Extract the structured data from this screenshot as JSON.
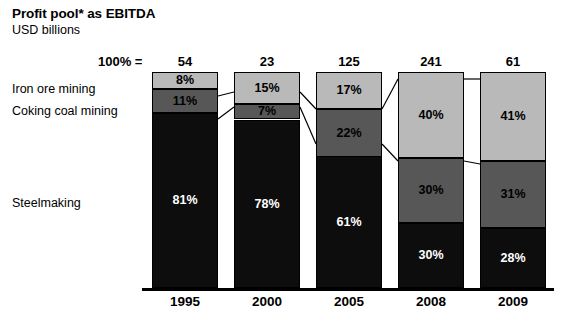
{
  "header": {
    "title": "Profit pool* as EBITDA",
    "subtitle": "USD billions"
  },
  "axis": {
    "total_prefix": "100% =",
    "years": [
      "1995",
      "2000",
      "2005",
      "2008",
      "2009"
    ],
    "totals": [
      "54",
      "23",
      "125",
      "241",
      "61"
    ]
  },
  "categories": [
    {
      "key": "iron_ore",
      "label": "Iron ore mining",
      "color": "#b9b9b9"
    },
    {
      "key": "coking_coal",
      "label": "Coking coal mining",
      "color": "#575757"
    },
    {
      "key": "steelmaking",
      "label": "Steelmaking",
      "color": "#0d0d0d"
    }
  ],
  "labels": {
    "iron_ore": [
      "8%",
      "15%",
      "17%",
      "40%",
      "41%"
    ],
    "coking_coal": [
      "11%",
      "7%",
      "22%",
      "30%",
      "31%"
    ],
    "steelmaking": [
      "81%",
      "78%",
      "61%",
      "30%",
      "28%"
    ]
  },
  "chart_data": {
    "type": "bar",
    "title": "Profit pool* as EBITDA",
    "subtitle": "USD billions",
    "xlabel": "",
    "ylabel": "",
    "ylim": [
      0,
      100
    ],
    "grid": false,
    "legend": "inline-left-labels",
    "stacked": true,
    "stack_normalized_percent": true,
    "categories": [
      "1995",
      "2000",
      "2005",
      "2008",
      "2009"
    ],
    "totals_label": "100% =",
    "totals": [
      54,
      23,
      125,
      241,
      61
    ],
    "totals_units": "USD billions",
    "series": [
      {
        "name": "Iron ore mining",
        "values": [
          8,
          15,
          17,
          40,
          41
        ],
        "color": "#b9b9b9"
      },
      {
        "name": "Coking coal mining",
        "values": [
          11,
          7,
          22,
          30,
          30
        ],
        "color": "#575757"
      },
      {
        "name": "Steelmaking",
        "values": [
          81,
          78,
          61,
          30,
          28
        ],
        "color": "#0d0d0d"
      }
    ],
    "data_labels": {
      "Iron ore mining": [
        "8%",
        "15%",
        "17%",
        "40%",
        "41%"
      ],
      "Coking coal mining": [
        "11%",
        "7%",
        "22%",
        "30%",
        "31%"
      ],
      "Steelmaking": [
        "81%",
        "78%",
        "61%",
        "30%",
        "28%"
      ]
    },
    "annotations": [
      "* footnote marker on 'Profit pool*'"
    ]
  }
}
